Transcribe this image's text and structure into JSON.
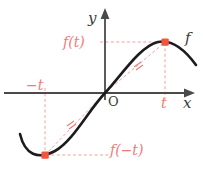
{
  "figure": {
    "kind": "coordinate-plane-diagram",
    "colors": {
      "axis": "#4a4a4a",
      "curve": "#1c1c1c",
      "accent_red": "#f26b6b",
      "label_red": "#f07a7a",
      "dashed_red": "#f3a0a0",
      "label_dark": "#3a3a3a",
      "background": "#ffffff"
    },
    "axes": {
      "origin_label": "O",
      "y_axis_label": "y",
      "x_axis_label": "x",
      "origin_px": [
        105,
        93
      ],
      "y_axis_top_px": 12,
      "x_axis_right_px": 192
    },
    "curve": {
      "function_label": "f",
      "shape": "cubic-like S curve, odd symmetry about origin",
      "path": "M 20 134 C 26 157, 40 160, 56 150 C 74 139, 88 110, 105 93 C 122 76, 140 46, 158 42 C 172 39, 184 49, 196 64"
    },
    "points": [
      {
        "name": "point-t",
        "x_label": "t",
        "y_label": "f(t)",
        "px": [
          165,
          42
        ]
      },
      {
        "name": "point-neg-t",
        "x_label": "-t",
        "y_label": "f(-t)",
        "px": [
          45,
          155
        ]
      }
    ],
    "labels": {
      "f_of_t": "f(t)",
      "f_of_neg_t": "f(−t)",
      "neg_t": "−t",
      "t": "t",
      "y": "y",
      "x": "x",
      "origin": "O",
      "f": "f"
    },
    "congruence_marks": {
      "count": 2,
      "style": "double hatch tick on each dashed radius from origin to point",
      "positions_px": [
        [
          138,
          68
        ],
        [
          71,
          127
        ]
      ]
    },
    "guide_lines": [
      {
        "name": "horizontal-guide-ft",
        "from_px": [
          100,
          42
        ],
        "to_px": [
          165,
          42
        ]
      },
      {
        "name": "vertical-guide-t",
        "from_px": [
          165,
          42
        ],
        "to_px": [
          165,
          100
        ]
      },
      {
        "name": "horizontal-guide-fmt",
        "from_px": [
          45,
          155
        ],
        "to_px": [
          110,
          155
        ]
      },
      {
        "name": "vertical-guide-negt",
        "from_px": [
          45,
          88
        ],
        "to_px": [
          45,
          155
        ]
      },
      {
        "name": "diagonal-radius-upper",
        "from_px": [
          105,
          93
        ],
        "to_px": [
          165,
          42
        ]
      },
      {
        "name": "diagonal-radius-lower",
        "from_px": [
          105,
          93
        ],
        "to_px": [
          45,
          155
        ]
      }
    ]
  }
}
